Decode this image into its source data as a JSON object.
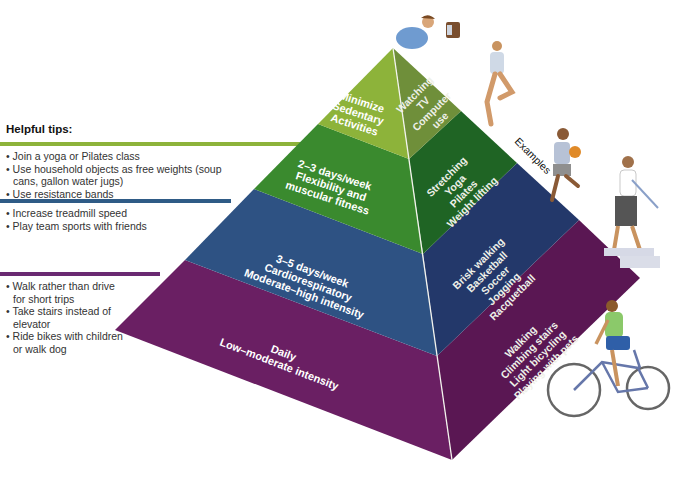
{
  "tips": {
    "title": "Helpful tips:",
    "groups": [
      {
        "level": "flexibility",
        "color": "#8db33a",
        "items": [
          "Join a yoga or Pilates class",
          "Use household objects as free weights (soup cans, gallon water jugs)",
          "Use resistance bands"
        ]
      },
      {
        "level": "cardio",
        "color": "#2f5b86",
        "items": [
          "Increase treadmill speed",
          "Play team sports with friends"
        ]
      },
      {
        "level": "daily",
        "color": "#6a2a72",
        "items": [
          "Walk rather than drive for short trips",
          "Take stairs instead of elevator",
          "Ride bikes with children or walk dog"
        ]
      }
    ]
  },
  "pyramid": {
    "examples_label": "Examples",
    "levels": [
      {
        "name": "sedentary",
        "front_color": "#8db33a",
        "side_color": "#6f8f3a",
        "label": [
          "Minimize",
          "Sedentary",
          "Activities"
        ],
        "examples": [
          "Watching",
          "TV",
          "Computer",
          "use"
        ]
      },
      {
        "name": "flexibility",
        "front_color": "#3a8a2e",
        "side_color": "#1f6424",
        "label": [
          "2–3 days/week",
          "Flexibility and",
          "muscular fitness"
        ],
        "examples": [
          "Stretching",
          "Yoga",
          "Pilates",
          "Weight lifting"
        ]
      },
      {
        "name": "cardio",
        "front_color": "#2e5283",
        "side_color": "#23386a",
        "label": [
          "3–5 days/week",
          "Cardiorespiratory",
          "Moderate–high intensity"
        ],
        "examples": [
          "Brisk walking",
          "Basketball",
          "Soccer",
          "Jogging",
          "Racquetball"
        ]
      },
      {
        "name": "daily",
        "front_color": "#6a1f63",
        "side_color": "#5a1753",
        "label": [
          "Daily",
          "Low–moderate intensity"
        ],
        "examples": [
          "Walking",
          "Climbing stairs",
          "Light bicycling",
          "Playing with pets"
        ]
      }
    ]
  },
  "illustrations": [
    "person-watching-tv",
    "person-yoga",
    "person-basketball",
    "person-climbing-stairs",
    "person-bicycling"
  ]
}
